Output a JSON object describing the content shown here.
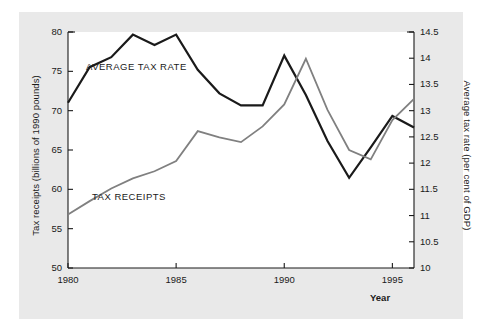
{
  "figure": {
    "background": "#ffffff",
    "panel_color": "#e9e9e9",
    "plot_background": "#ffffff"
  },
  "chart_data": {
    "type": "line",
    "title": "",
    "xlabel": "Year",
    "ylabel": "Tax receipts (billions of 1990 pounds)",
    "y2label": "Average tax rate (per cent of GDP)",
    "x": [
      1980,
      1981,
      1982,
      1983,
      1984,
      1985,
      1986,
      1987,
      1988,
      1989,
      1990,
      1991,
      1992,
      1993,
      1994,
      1995,
      1996
    ],
    "xlim": [
      1980,
      1996
    ],
    "xticks": [
      1980,
      1985,
      1990,
      1995
    ],
    "xticklabels": [
      "1980",
      "1985",
      "1990",
      "1995"
    ],
    "ylim": [
      50,
      80
    ],
    "yticks": [
      50,
      55,
      60,
      65,
      70,
      75,
      80
    ],
    "yticklabels": [
      "50",
      "55",
      "60",
      "65",
      "70",
      "75",
      "80"
    ],
    "y2lim": [
      10,
      14.5
    ],
    "y2ticks": [
      10,
      10.5,
      11,
      11.5,
      12,
      12.5,
      13,
      13.5,
      14,
      14.5
    ],
    "y2ticklabels": [
      "10",
      "10.5",
      "11",
      "11.5",
      "12",
      "12.5",
      "13",
      "13.5",
      "14",
      "14.5"
    ],
    "grid": false,
    "legend_position": "inline-annotations",
    "series": [
      {
        "name": "AVERAGE TAX RATE",
        "axis": "right",
        "color": "#1a1a1a",
        "width": 2.2,
        "units": "per cent of GDP",
        "values": [
          13.15,
          13.83,
          14.02,
          14.45,
          14.25,
          14.45,
          13.78,
          13.33,
          13.1,
          13.1,
          14.05,
          13.3,
          12.42,
          11.72,
          12.3,
          12.9,
          12.68
        ]
      },
      {
        "name": "TAX RECEIPTS",
        "axis": "left",
        "color": "#808080",
        "width": 1.8,
        "units": "billions of 1990 pounds",
        "values": [
          56.8,
          58.5,
          60.1,
          61.4,
          62.3,
          63.6,
          67.4,
          66.6,
          66.0,
          68.0,
          70.8,
          76.6,
          70.1,
          65.0,
          63.8,
          68.8,
          71.5
        ]
      }
    ],
    "annotations": [
      {
        "text": "AVERAGE TAX RATE",
        "x": 1981.2,
        "y_px": 61
      },
      {
        "text": "TAX RECEIPTS",
        "x": 1981.6,
        "y_px": 191
      }
    ]
  },
  "labels": {
    "y_axis_left": "Tax receipts (billions of 1990 pounds)",
    "y_axis_right": "Average tax rate (per cent of GDP)",
    "x_axis": "Year",
    "series_avg": "AVERAGE TAX RATE",
    "series_receipts": "TAX RECEIPTS"
  }
}
